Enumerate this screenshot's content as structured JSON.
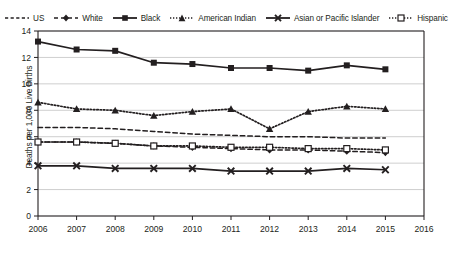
{
  "chart_data": {
    "type": "line",
    "title": "",
    "xlabel": "",
    "ylabel": "Deaths per 1,000 Live Births",
    "x": [
      2006,
      2007,
      2008,
      2009,
      2010,
      2011,
      2012,
      2013,
      2014,
      2015
    ],
    "xlim": [
      2006,
      2016
    ],
    "ylim": [
      0,
      14
    ],
    "yticks": [
      0,
      2,
      4,
      6,
      8,
      10,
      12,
      14
    ],
    "xticks": [
      2006,
      2007,
      2008,
      2009,
      2010,
      2011,
      2012,
      2013,
      2014,
      2015,
      2016
    ],
    "grid": "horizontal",
    "legend_position": "top",
    "series": [
      {
        "name": "US",
        "line_style": "dashed",
        "marker": "none",
        "color": "#231f20",
        "values": [
          6.7,
          6.7,
          6.6,
          6.4,
          6.2,
          6.1,
          6.0,
          6.0,
          5.9,
          5.9
        ]
      },
      {
        "name": "White",
        "line_style": "dashed",
        "marker": "diamond",
        "color": "#231f20",
        "values": [
          5.6,
          5.6,
          5.5,
          5.3,
          5.2,
          5.1,
          5.0,
          5.0,
          4.9,
          4.8
        ]
      },
      {
        "name": "Black",
        "line_style": "solid",
        "marker": "square",
        "color": "#231f20",
        "values": [
          13.2,
          12.6,
          12.5,
          11.6,
          11.5,
          11.2,
          11.2,
          11.0,
          11.4,
          11.1
        ]
      },
      {
        "name": "American Indian",
        "line_style": "dotted",
        "marker": "triangle",
        "color": "#231f20",
        "values": [
          8.6,
          8.1,
          8.0,
          7.6,
          7.9,
          8.1,
          6.6,
          7.9,
          8.3,
          8.1
        ]
      },
      {
        "name": "Asian or Pacific Islander",
        "line_style": "solid",
        "marker": "cross",
        "color": "#231f20",
        "values": [
          3.8,
          3.8,
          3.6,
          3.6,
          3.6,
          3.4,
          3.4,
          3.4,
          3.6,
          3.5
        ]
      },
      {
        "name": "Hispanic",
        "line_style": "dotted",
        "marker": "open-square",
        "color": "#231f20",
        "values": [
          5.6,
          5.6,
          5.5,
          5.3,
          5.3,
          5.2,
          5.2,
          5.1,
          5.1,
          5.0
        ]
      }
    ]
  },
  "legend": {
    "items": [
      {
        "label": "US",
        "glyph": "dashed-line-icon"
      },
      {
        "label": "White",
        "glyph": "dashed-diamond-icon"
      },
      {
        "label": "Black",
        "glyph": "solid-square-icon"
      },
      {
        "label": "American Indian",
        "glyph": "dotted-triangle-icon"
      },
      {
        "label": "Asian or Pacific Islander",
        "glyph": "solid-cross-icon"
      },
      {
        "label": "Hispanic",
        "glyph": "dotted-open-square-icon"
      }
    ]
  },
  "axes": {
    "y_axis_title": "Deaths per 1,000 Live Births"
  }
}
